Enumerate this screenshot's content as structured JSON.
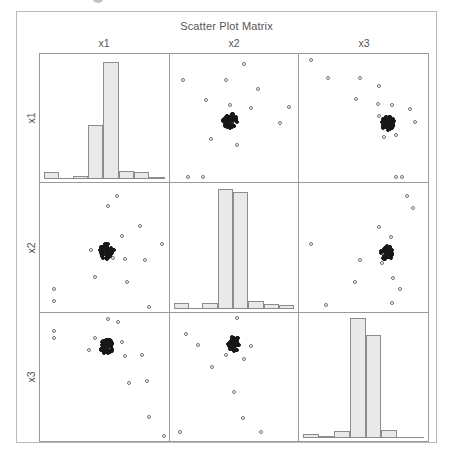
{
  "chart_data": {
    "type": "scatter",
    "title": "Scatter Plot Matrix",
    "subtype": "scatter-plot-matrix",
    "variables": [
      "x1",
      "x2",
      "x3"
    ],
    "column_headers": [
      "x1",
      "x2",
      "x3"
    ],
    "row_labels": [
      "x1",
      "x2",
      "x3"
    ],
    "grid": false,
    "legend": "none",
    "axis_ticks": "none",
    "diagonal": "histogram",
    "colors": {
      "frame": "#b9b9b9",
      "panel_border": "#9a9a9a",
      "bar_fill": "#e9e9e9",
      "bar_border": "#8c8c8c",
      "point_outline": "#6f6f6f",
      "point_dense": "#171717",
      "text": "#555555",
      "background": "#ffffff"
    },
    "histograms": [
      {
        "variable": "x1",
        "panel": "1,1",
        "bin_heights": [
          0.06,
          0.0,
          0.03,
          0.45,
          0.97,
          0.07,
          0.06,
          0.02
        ],
        "note": "unimodal, tall single peak slightly right of center"
      },
      {
        "variable": "x2",
        "panel": "2,2",
        "bin_heights": [
          0.05,
          0.0,
          0.05,
          0.99,
          0.96,
          0.06,
          0.04,
          0.03
        ],
        "note": "two adjacent very tall central bars"
      },
      {
        "variable": "x3",
        "panel": "3,3",
        "bin_heights": [
          0.03,
          0.02,
          0.06,
          0.99,
          0.85,
          0.07,
          0.0,
          0.0
        ],
        "note": "left-skewed with tall pair right of center"
      }
    ],
    "scatter_panels": [
      {
        "panel": "1,2",
        "xlabel": "x2",
        "ylabel": "x1",
        "cluster": {
          "cx": 0.47,
          "cy": 0.52,
          "rx": 0.055,
          "ry": 0.065,
          "n": 60
        },
        "outliers": [
          [
            0.58,
            0.08
          ],
          [
            0.1,
            0.2
          ],
          [
            0.44,
            0.2
          ],
          [
            0.69,
            0.27
          ],
          [
            0.28,
            0.36
          ],
          [
            0.47,
            0.4
          ],
          [
            0.63,
            0.42
          ],
          [
            0.93,
            0.41
          ],
          [
            0.86,
            0.54
          ],
          [
            0.32,
            0.66
          ],
          [
            0.52,
            0.71
          ],
          [
            0.14,
            0.96
          ],
          [
            0.26,
            0.96
          ]
        ]
      },
      {
        "panel": "1,3",
        "xlabel": "x3",
        "ylabel": "x1",
        "cluster": {
          "cx": 0.69,
          "cy": 0.54,
          "rx": 0.05,
          "ry": 0.055,
          "n": 60
        },
        "outliers": [
          [
            0.09,
            0.05
          ],
          [
            0.22,
            0.19
          ],
          [
            0.47,
            0.19
          ],
          [
            0.62,
            0.25
          ],
          [
            0.44,
            0.35
          ],
          [
            0.61,
            0.39
          ],
          [
            0.72,
            0.4
          ],
          [
            0.86,
            0.43
          ],
          [
            0.62,
            0.48
          ],
          [
            0.9,
            0.53
          ],
          [
            0.66,
            0.65
          ],
          [
            0.75,
            0.63
          ],
          [
            0.75,
            0.96
          ],
          [
            0.8,
            0.96
          ]
        ]
      },
      {
        "panel": "2,1",
        "xlabel": "x1",
        "ylabel": "x2",
        "cluster": {
          "cx": 0.52,
          "cy": 0.53,
          "rx": 0.055,
          "ry": 0.06,
          "n": 60
        },
        "outliers": [
          [
            0.6,
            0.1
          ],
          [
            0.53,
            0.18
          ],
          [
            0.78,
            0.33
          ],
          [
            0.64,
            0.41
          ],
          [
            0.4,
            0.52
          ],
          [
            0.95,
            0.47
          ],
          [
            0.57,
            0.58
          ],
          [
            0.66,
            0.59
          ],
          [
            0.82,
            0.6
          ],
          [
            0.43,
            0.73
          ],
          [
            0.68,
            0.77
          ],
          [
            0.11,
            0.82
          ],
          [
            0.11,
            0.92
          ],
          [
            0.85,
            0.96
          ]
        ]
      },
      {
        "panel": "2,3",
        "xlabel": "x3",
        "ylabel": "x2",
        "cluster": {
          "cx": 0.68,
          "cy": 0.54,
          "rx": 0.05,
          "ry": 0.055,
          "n": 60
        },
        "outliers": [
          [
            0.84,
            0.1
          ],
          [
            0.88,
            0.19
          ],
          [
            0.62,
            0.34
          ],
          [
            0.71,
            0.42
          ],
          [
            0.09,
            0.47
          ],
          [
            0.47,
            0.6
          ],
          [
            0.64,
            0.62
          ],
          [
            0.43,
            0.77
          ],
          [
            0.73,
            0.74
          ],
          [
            0.78,
            0.82
          ],
          [
            0.72,
            0.93
          ],
          [
            0.21,
            0.95
          ]
        ]
      },
      {
        "panel": "3,1",
        "xlabel": "x1",
        "ylabel": "x3",
        "cluster": {
          "cx": 0.52,
          "cy": 0.26,
          "rx": 0.05,
          "ry": 0.06,
          "n": 60
        },
        "outliers": [
          [
            0.53,
            0.05
          ],
          [
            0.61,
            0.07
          ],
          [
            0.11,
            0.14
          ],
          [
            0.11,
            0.2
          ],
          [
            0.43,
            0.2
          ],
          [
            0.64,
            0.23
          ],
          [
            0.38,
            0.29
          ],
          [
            0.66,
            0.34
          ],
          [
            0.79,
            0.33
          ],
          [
            0.69,
            0.55
          ],
          [
            0.83,
            0.53
          ],
          [
            0.85,
            0.81
          ],
          [
            0.96,
            0.96
          ]
        ]
      },
      {
        "panel": "3,2",
        "xlabel": "x2",
        "ylabel": "x3",
        "cluster": {
          "cx": 0.5,
          "cy": 0.24,
          "rx": 0.05,
          "ry": 0.06,
          "n": 60
        },
        "outliers": [
          [
            0.52,
            0.04
          ],
          [
            0.13,
            0.17
          ],
          [
            0.22,
            0.25
          ],
          [
            0.44,
            0.33
          ],
          [
            0.58,
            0.36
          ],
          [
            0.63,
            0.26
          ],
          [
            0.33,
            0.42
          ],
          [
            0.5,
            0.62
          ],
          [
            0.57,
            0.82
          ],
          [
            0.71,
            0.93
          ],
          [
            0.08,
            0.93
          ]
        ]
      }
    ]
  }
}
